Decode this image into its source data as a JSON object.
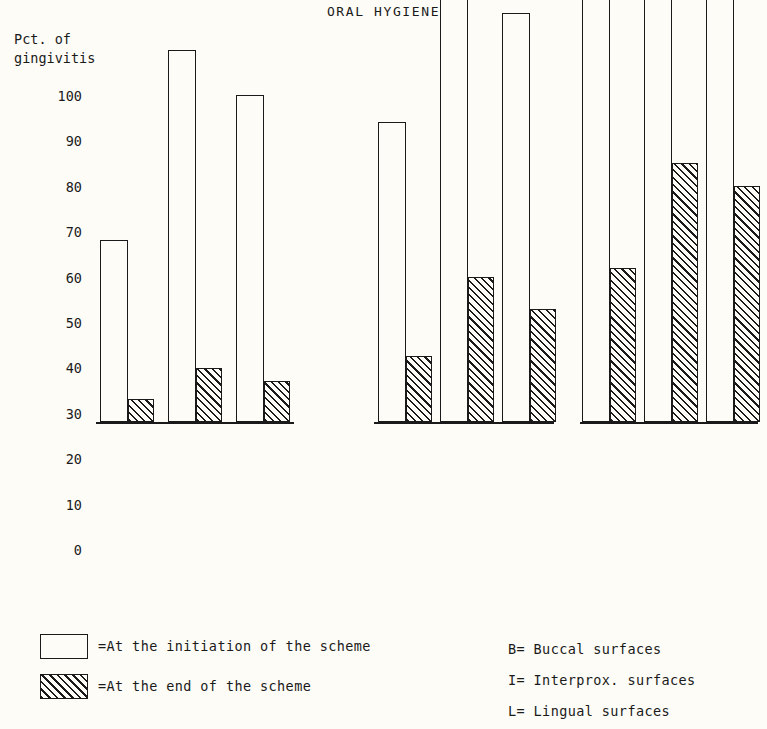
{
  "chart_data": {
    "type": "bar",
    "title": "ORAL HYGIENE",
    "ylabel_line1": "Pct. of",
    "ylabel_line2": "gingivitis",
    "xlabel": "",
    "ylim": [
      0,
      100
    ],
    "yticks": [
      100,
      90,
      80,
      70,
      60,
      50,
      40,
      30,
      20,
      10,
      0
    ],
    "grid": false,
    "legend_position": "below-left",
    "categories": [
      "B",
      "I",
      "L"
    ],
    "groups": [
      {
        "label": "Good",
        "bars": [
          {
            "category": "B",
            "initiation": 40,
            "end": 5
          },
          {
            "category": "I",
            "initiation": 82,
            "end": 12
          },
          {
            "category": "L",
            "initiation": 72,
            "end": 9
          }
        ]
      },
      {
        "label": "Fairly good",
        "bars": [
          {
            "category": "B",
            "initiation": 66,
            "end": 14.5
          },
          {
            "category": "I",
            "initiation": 98,
            "end": 32
          },
          {
            "category": "L",
            "initiation": 90,
            "end": 25
          }
        ]
      },
      {
        "label": "Not good",
        "bars": [
          {
            "category": "B",
            "initiation": 95,
            "end": 34
          },
          {
            "category": "I",
            "initiation": 99,
            "end": 57
          },
          {
            "category": "L",
            "initiation": 99,
            "end": 52
          }
        ]
      }
    ],
    "series": [
      {
        "name": "At the initiation of the scheme",
        "style": "open"
      },
      {
        "name": "At the end of the scheme",
        "style": "hatched"
      }
    ]
  },
  "legend_left": [
    {
      "swatch": "open",
      "text": "=At the initiation of the scheme"
    },
    {
      "swatch": "hatched",
      "text": "=At the end of the scheme"
    }
  ],
  "legend_right": [
    "B= Buccal surfaces",
    "I= Interprox. surfaces",
    "L= Lingual surfaces"
  ],
  "colors": {
    "ink": "#1a1a1a",
    "paper": "#fdfcf7"
  }
}
